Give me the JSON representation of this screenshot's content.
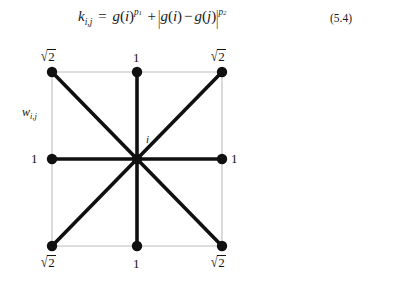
{
  "equation": {
    "lhs_symbol": "k",
    "lhs_subscript": "i,j",
    "equals": "=",
    "term1_func": "g",
    "term1_arg": "i",
    "term1_exponent": "p",
    "term1_exponent_index": "1",
    "plus": "+",
    "abs_open": "|",
    "term2_func_a": "g",
    "term2_arg_a": "i",
    "minus": "−",
    "term2_func_b": "g",
    "term2_arg_b": "j",
    "abs_close": "|",
    "term2_exponent": "p",
    "term2_exponent_index": "2",
    "number": "(5.4)",
    "plain_text": "k(i,j) = g(i)^p1 + |g(i) - g(j)|^p2"
  },
  "diagram": {
    "weights_label": {
      "symbol": "w",
      "subscript": "i,j"
    },
    "center_label": "i",
    "grid_color": "#d2d2d2",
    "edge_color": "#101010",
    "node_color": "#101010",
    "nodes": [
      {
        "id": "top-left",
        "label": "√2",
        "label_kind": "sqrt2",
        "cx": 52,
        "cy": 34,
        "lx": 41,
        "ly": 11,
        "edge": true
      },
      {
        "id": "top-center",
        "label": "1",
        "label_kind": "plain",
        "cx": 137,
        "cy": 34,
        "lx": 133,
        "ly": 13,
        "edge": true
      },
      {
        "id": "top-right",
        "label": "√2",
        "label_kind": "sqrt2",
        "cx": 222,
        "cy": 34,
        "lx": 211,
        "ly": 11,
        "edge": true
      },
      {
        "id": "middle-left",
        "label": "1",
        "label_kind": "plain",
        "cx": 52,
        "cy": 121,
        "lx": 31,
        "ly": 114,
        "edge": true
      },
      {
        "id": "center",
        "label": "",
        "label_kind": "none",
        "cx": 137,
        "cy": 121,
        "lx": 0,
        "ly": 0,
        "edge": false
      },
      {
        "id": "middle-right",
        "label": "1",
        "label_kind": "plain",
        "cx": 222,
        "cy": 121,
        "lx": 231,
        "ly": 114,
        "edge": true
      },
      {
        "id": "bottom-left",
        "label": "√2",
        "label_kind": "sqrt2",
        "cx": 52,
        "cy": 208,
        "lx": 41,
        "ly": 217,
        "edge": true
      },
      {
        "id": "bottom-center",
        "label": "1",
        "label_kind": "plain",
        "cx": 137,
        "cy": 208,
        "lx": 133,
        "ly": 219,
        "edge": true
      },
      {
        "id": "bottom-right",
        "label": "√2",
        "label_kind": "sqrt2",
        "cx": 222,
        "cy": 208,
        "lx": 211,
        "ly": 217,
        "edge": true
      }
    ],
    "weights_label_pos": {
      "x": 22,
      "y": 68
    },
    "center_label_pos": {
      "x": 146,
      "y": 96
    },
    "square": {
      "x": 52,
      "y": 34,
      "w": 170,
      "h": 174
    }
  }
}
